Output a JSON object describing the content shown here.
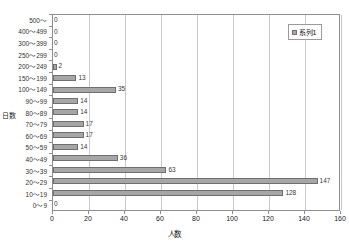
{
  "chart_data": {
    "type": "bar",
    "orientation": "horizontal",
    "title": "",
    "xlabel": "人数",
    "ylabel": "日数",
    "xlim": [
      0,
      160
    ],
    "xticks": [
      0,
      20,
      40,
      60,
      80,
      100,
      120,
      140,
      160
    ],
    "grid": true,
    "grid_axis": "x",
    "legend_position": "top-right",
    "legend": [
      "系列1"
    ],
    "series_name": "系列1",
    "bar_color": "#a6a6a6",
    "bar_border_color": "#6f6f6f",
    "categories": [
      "500～",
      "400～499",
      "300～399",
      "250～299",
      "200～249",
      "150～199",
      "100～149",
      "90～99",
      "80～89",
      "70～79",
      "60～69",
      "50～59",
      "40～49",
      "30～39",
      "20～29",
      "10～19",
      "0～9"
    ],
    "values": [
      0,
      0,
      0,
      0,
      2,
      13,
      35,
      14,
      14,
      17,
      17,
      14,
      36,
      63,
      147,
      128,
      0
    ],
    "data_labels": [
      "0",
      "0",
      "0",
      "0",
      "2",
      "13",
      "35",
      "14",
      "14",
      "17",
      "17",
      "14",
      "36",
      "63",
      "147",
      "128",
      "0"
    ]
  },
  "axes": {
    "x_title": "人数",
    "y_title": "日数",
    "x_tick_labels": [
      "0",
      "20",
      "40",
      "60",
      "80",
      "100",
      "120",
      "140",
      "160"
    ]
  },
  "legend": {
    "entries": [
      {
        "label": "系列1",
        "color": "#a6a6a6"
      }
    ]
  }
}
